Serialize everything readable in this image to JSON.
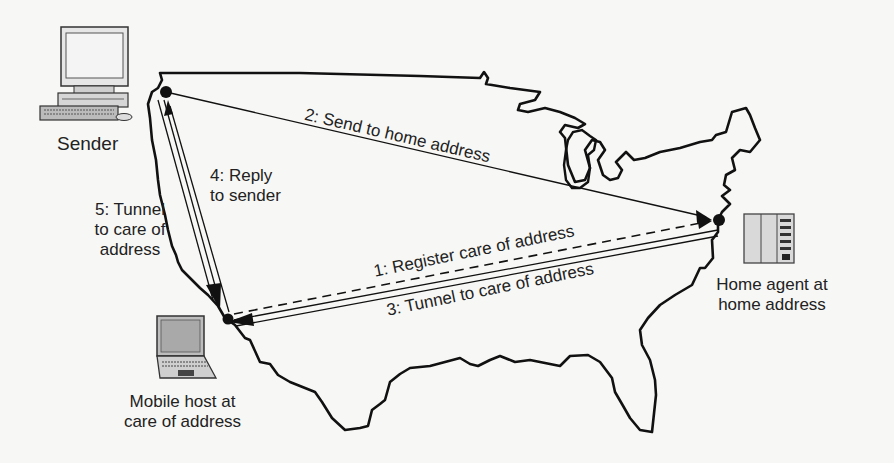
{
  "figure": {
    "type": "mobile-ip-routing-diagram",
    "nodes": {
      "sender": {
        "label": "Sender",
        "icon": "desktop-computer-icon"
      },
      "home_agent": {
        "label_line1": "Home agent at",
        "label_line2": "home address",
        "icon": "server-icon"
      },
      "mobile_host": {
        "label_line1": "Mobile host at",
        "label_line2": "care of address",
        "icon": "laptop-icon"
      }
    },
    "steps": [
      {
        "id": 1,
        "label": "1: Register care of address",
        "from": "mobile_host",
        "to": "home_agent",
        "style": "dashed"
      },
      {
        "id": 2,
        "label": "2: Send to home address",
        "from": "sender",
        "to": "home_agent",
        "style": "single"
      },
      {
        "id": 3,
        "label": "3: Tunnel to care of address",
        "from": "home_agent",
        "to": "mobile_host",
        "style": "double"
      },
      {
        "id": 4,
        "label_line1": "4: Reply",
        "label_line2": "to sender",
        "from": "mobile_host",
        "to": "sender",
        "style": "single"
      },
      {
        "id": 5,
        "label_line1": "5: Tunnel",
        "label_line2": "to care of",
        "label_line3": "address",
        "from": "sender",
        "to": "mobile_host",
        "style": "double"
      }
    ],
    "colors": {
      "ink": "#111111",
      "background": "#f7f7f5",
      "device_fill": "#d8d8d8"
    }
  }
}
